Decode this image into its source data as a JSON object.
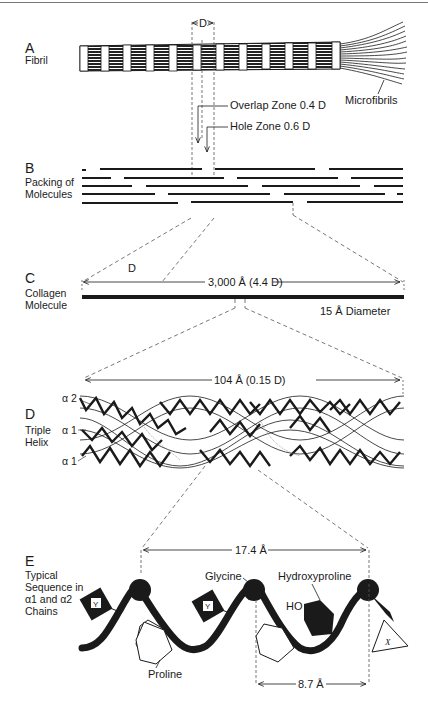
{
  "figure": {
    "panels": {
      "A": {
        "letter": "A",
        "name": "Fibril",
        "period_label": "D",
        "overlap_label": "Overlap Zone 0.4 D",
        "hole_label": "Hole Zone 0.6 D",
        "end_label": "Microfibrils"
      },
      "B": {
        "letter": "B",
        "name_line1": "Packing of",
        "name_line2": "Molecules"
      },
      "C": {
        "letter": "C",
        "name_line1": "Collagen",
        "name_line2": "Molecule",
        "d_label": "D",
        "length_label": "3,000 Å (4.4 D)",
        "diameter_label": "15 Å Diameter"
      },
      "D": {
        "letter": "D",
        "name_line1": "Triple",
        "name_line2": "Helix",
        "length_label": "104 Å (0.15 D)",
        "chains": [
          "α 2",
          "α 1",
          "α 1"
        ]
      },
      "E": {
        "letter": "E",
        "name_line1": "Typical",
        "name_line2": "Sequence in",
        "name_line3": "α1 and α2",
        "name_line4": "Chains",
        "repeat_label": "17.4 Å",
        "half_label": "8.7 Å",
        "glycine_label": "Glycine",
        "hydroxyproline_label": "Hydroxyproline",
        "ho_label": "HO",
        "proline_label": "Proline",
        "y_residue": "Y",
        "x_residue": "X"
      }
    },
    "colors": {
      "ink": "#1a1a1a",
      "dashed": "#555555",
      "paper": "#ffffff"
    }
  }
}
